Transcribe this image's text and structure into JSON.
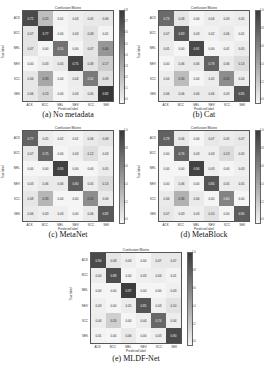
{
  "chart_data": [
    {
      "type": "heatmap",
      "title": "Confusion Matrix",
      "caption": "(a) No metadata",
      "xlabel": "Predicted label",
      "ylabel": "True label",
      "labels": [
        "ACK",
        "BCC",
        "MEL",
        "NEV",
        "SCC",
        "SEK"
      ],
      "colorbar_ticks": [
        "0.8",
        "0.7",
        "0.6",
        "0.5",
        "0.4",
        "0.3",
        "0.2",
        "0.1",
        "0.0"
      ],
      "matrix": [
        [
          0.72,
          0.23,
          0.01,
          0.03,
          0.05,
          0.06
        ],
        [
          0.07,
          0.77,
          0.0,
          0.03,
          0.08,
          0.01
        ],
        [
          0.07,
          0.0,
          0.55,
          0.0,
          0.07,
          0.4
        ],
        [
          0.0,
          0.03,
          0.05,
          0.75,
          0.08,
          0.17
        ],
        [
          0.06,
          0.33,
          0.0,
          0.04,
          0.52,
          0.09
        ],
        [
          0.06,
          0.13,
          0.0,
          0.03,
          0.05,
          0.82
        ]
      ]
    },
    {
      "type": "heatmap",
      "title": "Confusion Matrix",
      "caption": "(b) Cat",
      "xlabel": "Predicted label",
      "ylabel": "True label",
      "labels": [
        "ACK",
        "BCC",
        "MEL",
        "NEV",
        "SCC",
        "SEK"
      ],
      "colorbar_ticks": [
        "1.0",
        "0.8",
        "0.6",
        "0.4",
        "0.2",
        "0.0"
      ],
      "matrix": [
        [
          0.73,
          0.08,
          0.0,
          0.04,
          0.03,
          0.05
        ],
        [
          0.07,
          0.83,
          0.03,
          0.02,
          0.06,
          0.01
        ],
        [
          0.05,
          0.0,
          0.91,
          0.0,
          0.01,
          0.05
        ],
        [
          0.0,
          0.06,
          0.06,
          0.78,
          0.06,
          0.13
        ],
        [
          0.04,
          0.3,
          0.0,
          0.05,
          0.55,
          0.04
        ],
        [
          0.06,
          0.06,
          0.06,
          0.06,
          0.03,
          0.85
        ]
      ]
    },
    {
      "type": "heatmap",
      "title": "Confusion Matrix",
      "caption": "(c) MetaNet",
      "xlabel": "Predicted label",
      "ylabel": "True label",
      "labels": [
        "ACK",
        "BCC",
        "MEL",
        "NEV",
        "SCC",
        "SEK"
      ],
      "colorbar_ticks": [
        "1.0",
        "0.8",
        "0.6",
        "0.4",
        "0.2",
        "0.0"
      ],
      "matrix": [
        [
          0.77,
          0.05,
          0.02,
          0.01,
          0.06,
          0.09
        ],
        [
          0.07,
          0.75,
          0.0,
          0.03,
          0.12,
          0.03
        ],
        [
          0.0,
          0.0,
          0.95,
          0.0,
          0.0,
          0.05
        ],
        [
          0.03,
          0.06,
          0.06,
          0.8,
          0.05,
          0.13
        ],
        [
          0.08,
          0.33,
          0.0,
          0.0,
          0.55,
          0.06
        ],
        [
          0.06,
          0.03,
          0.03,
          0.0,
          0.06,
          0.82
        ]
      ]
    },
    {
      "type": "heatmap",
      "title": "Confusion Matrix",
      "caption": "(d) MetaBlock",
      "xlabel": "Predicted label",
      "ylabel": "True label",
      "labels": [
        "ACK",
        "BCC",
        "MEL",
        "NEV",
        "SCC",
        "SEK"
      ],
      "colorbar_ticks": [
        "1.0",
        "0.8",
        "0.6",
        "0.4",
        "0.2",
        "0.0"
      ],
      "matrix": [
        [
          0.78,
          0.06,
          0.0,
          0.07,
          0.05,
          0.07
        ],
        [
          0.0,
          0.76,
          0.03,
          0.03,
          0.13,
          0.05
        ],
        [
          0.0,
          0.0,
          0.94,
          0.03,
          0.0,
          0.03
        ],
        [
          0.0,
          0.06,
          0.0,
          0.84,
          0.05,
          0.05
        ],
        [
          0.06,
          0.36,
          0.06,
          0.0,
          0.6,
          0.0
        ],
        [
          0.07,
          0.03,
          0.03,
          0.1,
          0.0,
          0.8
        ]
      ]
    },
    {
      "type": "heatmap",
      "title": "Confusion Matrix",
      "caption": "(e) MLDF-Net",
      "xlabel": "Predicted label",
      "ylabel": "True label",
      "labels": [
        "ACK",
        "BCC",
        "MEL",
        "NEV",
        "SCC",
        "SEK"
      ],
      "colorbar_ticks": [
        "1.0",
        "0.8",
        "0.6",
        "0.4",
        "0.2",
        "0.0"
      ],
      "matrix": [
        [
          0.9,
          0.08,
          0.03,
          0.0,
          0.07,
          0.07
        ],
        [
          0.04,
          0.88,
          0.0,
          0.03,
          0.04,
          0.01
        ],
        [
          0.0,
          0.0,
          0.97,
          0.0,
          0.0,
          0.03
        ],
        [
          0.03,
          0.0,
          0.05,
          0.85,
          0.03,
          0.1
        ],
        [
          0.04,
          0.2,
          0.0,
          0.04,
          0.74,
          0.04
        ],
        [
          0.01,
          0.0,
          0.06,
          0.0,
          0.03,
          0.9
        ]
      ]
    }
  ]
}
